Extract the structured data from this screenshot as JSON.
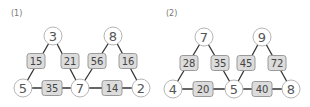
{
  "problems": [
    {
      "label": "(1)",
      "top_nodes": [
        {
          "value": "3",
          "x": 53,
          "y": 36
        },
        {
          "value": "8",
          "x": 113,
          "y": 36
        }
      ],
      "bottom_nodes": [
        {
          "value": "5",
          "x": 23,
          "y": 88
        },
        {
          "value": "7",
          "x": 80,
          "y": 88
        },
        {
          "value": "2",
          "x": 141,
          "y": 88
        }
      ],
      "side_boxes": [
        {
          "value": "15",
          "x": 36,
          "y": 61
        },
        {
          "value": "21",
          "x": 70,
          "y": 61
        },
        {
          "value": "56",
          "x": 97,
          "y": 61
        },
        {
          "value": "16",
          "x": 128,
          "y": 61
        }
      ],
      "base_boxes": [
        {
          "value": "35",
          "x": 52,
          "y": 88
        },
        {
          "value": "14",
          "x": 112,
          "y": 88
        }
      ]
    },
    {
      "label": "(2)",
      "top_nodes": [
        {
          "value": "7",
          "x": 204,
          "y": 37
        },
        {
          "value": "9",
          "x": 262,
          "y": 37
        }
      ],
      "bottom_nodes": [
        {
          "value": "4",
          "x": 173,
          "y": 89
        },
        {
          "value": "5",
          "x": 234,
          "y": 89
        },
        {
          "value": "8",
          "x": 291,
          "y": 89
        }
      ],
      "side_boxes": [
        {
          "value": "28",
          "x": 189,
          "y": 63
        },
        {
          "value": "35",
          "x": 220,
          "y": 63
        },
        {
          "value": "45",
          "x": 246,
          "y": 63
        },
        {
          "value": "72",
          "x": 277,
          "y": 63
        }
      ],
      "base_boxes": [
        {
          "value": "20",
          "x": 203,
          "y": 89
        },
        {
          "value": "40",
          "x": 262,
          "y": 89
        }
      ]
    }
  ],
  "colors": {
    "line": "#333333",
    "node_border": "#b5b5b5",
    "box_fill": "#dcdcdc",
    "box_border": "#9a9a9a"
  }
}
